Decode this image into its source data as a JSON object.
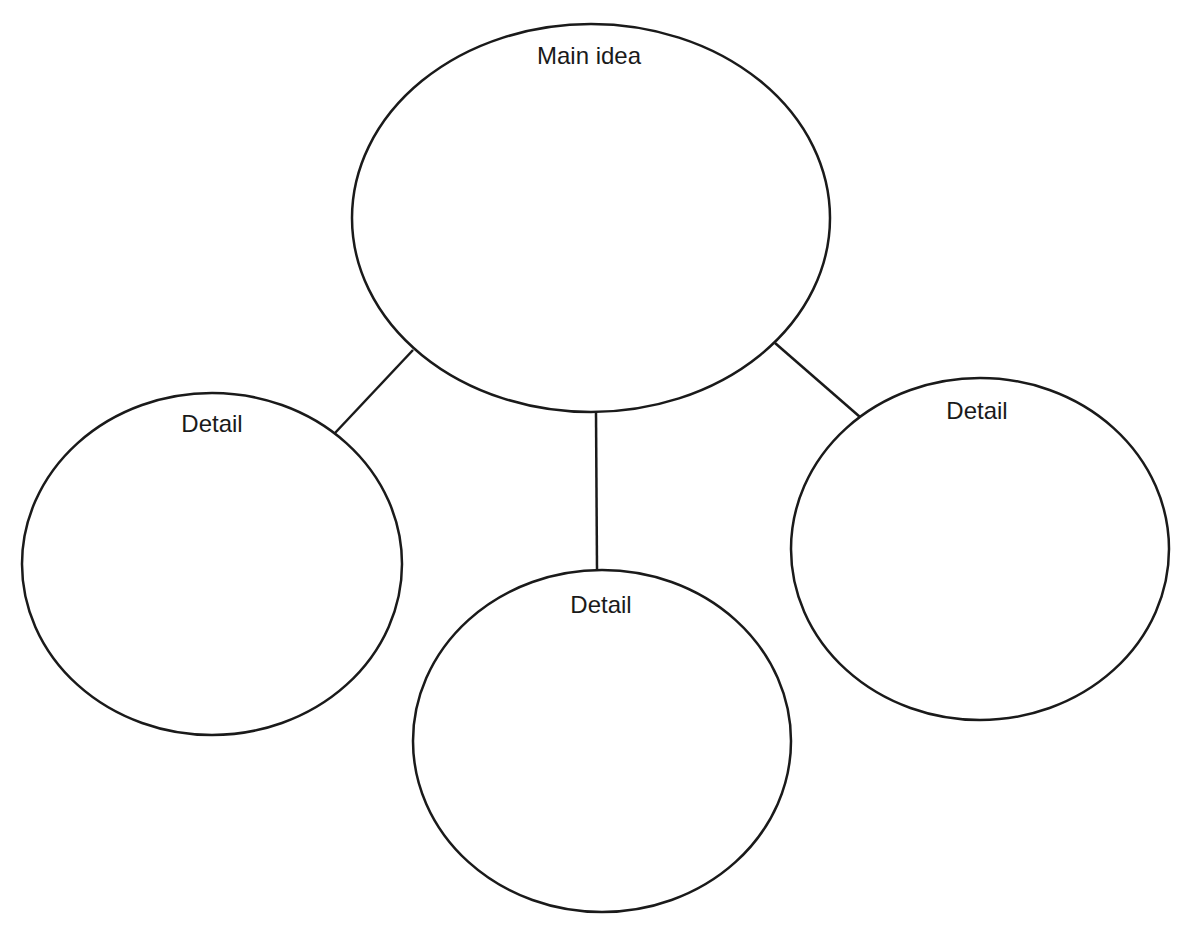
{
  "diagram": {
    "type": "main-idea-and-details web",
    "stroke_color": "#1a1a1a",
    "background": "#ffffff",
    "main": {
      "label": "Main idea",
      "cx": 591,
      "cy": 218,
      "rx": 239,
      "ry": 194,
      "label_x": 589,
      "label_y": 64
    },
    "details": [
      {
        "label": "Detail",
        "cx": 212,
        "cy": 564,
        "rx": 190,
        "ry": 171,
        "label_x": 212,
        "label_y": 432
      },
      {
        "label": "Detail",
        "cx": 602,
        "cy": 741,
        "rx": 189,
        "ry": 171,
        "label_x": 601,
        "label_y": 613
      },
      {
        "label": "Detail",
        "cx": 980,
        "cy": 549,
        "rx": 189,
        "ry": 171,
        "label_x": 977,
        "label_y": 419
      }
    ],
    "connectors": [
      {
        "x1": 413,
        "y1": 350,
        "x2": 335,
        "y2": 433
      },
      {
        "x1": 596,
        "y1": 412,
        "x2": 597,
        "y2": 570
      },
      {
        "x1": 775,
        "y1": 343,
        "x2": 860,
        "y2": 417
      }
    ]
  }
}
